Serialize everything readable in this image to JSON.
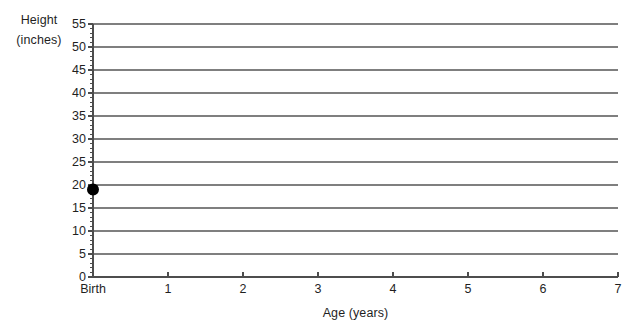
{
  "chart_data": {
    "type": "scatter",
    "title": "",
    "xlabel": "Age (years)",
    "ylabel_line1": "Height",
    "ylabel_line2": "(inches)",
    "ylabel": "Height (inches)",
    "x_tick_labels": [
      "Birth",
      "1",
      "2",
      "3",
      "4",
      "5",
      "6",
      "7"
    ],
    "x_tick_values": [
      0,
      1,
      2,
      3,
      4,
      5,
      6,
      7
    ],
    "xlim": [
      0,
      7
    ],
    "ylim": [
      0,
      55
    ],
    "y_tick_labels": [
      "55",
      "50",
      "45",
      "40",
      "35",
      "30",
      "25",
      "20",
      "15",
      "10",
      "5",
      "0"
    ],
    "y_tick_values": [
      55,
      50,
      45,
      40,
      35,
      30,
      25,
      20,
      15,
      10,
      5,
      0
    ],
    "y_major_step": 5,
    "y_minor_step": 1,
    "grid": "horizontal",
    "legend": "none",
    "series": [
      {
        "name": "Height at age",
        "marker": "filled-circle",
        "marker_color": "#000000",
        "marker_size_px": 12,
        "points": [
          {
            "x": 0,
            "x_label": "Birth",
            "y": 19
          }
        ]
      }
    ]
  },
  "style": {
    "background": "#ffffff",
    "gridline_color": "#7f7f7f",
    "axis_color": "#4d4d4d",
    "text_color": "#1f1f1f"
  },
  "geometry": {
    "plot_left": 93,
    "plot_right": 618,
    "plot_top": 24,
    "plot_bottom": 277
  }
}
